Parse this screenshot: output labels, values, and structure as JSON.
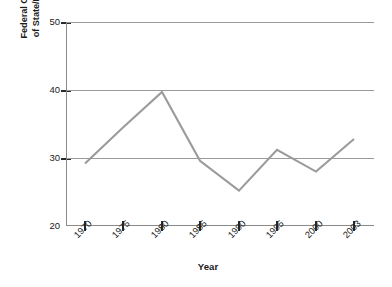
{
  "chart_data": {
    "type": "line",
    "title": "",
    "xlabel": "Year",
    "ylabel": "Federal Grants-in-Aid as Percentage of State/Local Government Budgets",
    "ylabel_lines": [
      "Federal Grants-in-Aid as Percentage",
      "of State/Local Government Budgets"
    ],
    "categories": [
      "1970",
      "1975",
      "1980",
      "1985",
      "1990",
      "1995",
      "2000",
      "2003"
    ],
    "x": [
      1970,
      1975,
      1980,
      1985,
      1990,
      1995,
      2000,
      2003
    ],
    "values": [
      29.2,
      34.5,
      39.7,
      29.6,
      25.2,
      31.2,
      28.0,
      32.8
    ],
    "series": [
      {
        "name": "Federal Grants-in-Aid",
        "values": [
          29.2,
          34.5,
          39.7,
          29.6,
          25.2,
          31.2,
          28.0,
          32.8
        ]
      }
    ],
    "ylim": [
      20,
      50
    ],
    "yticks": [
      20,
      30,
      40,
      50
    ],
    "ytick_labels": [
      "20",
      "30",
      "40",
      "50"
    ],
    "grid": "horizontal-at-30-40-50",
    "legend": "none",
    "line_color": "#9b9b9b",
    "grid_color": "#9a9a9a",
    "axis_color": "#8a8a8a",
    "text_color": "#1b1b1b"
  }
}
